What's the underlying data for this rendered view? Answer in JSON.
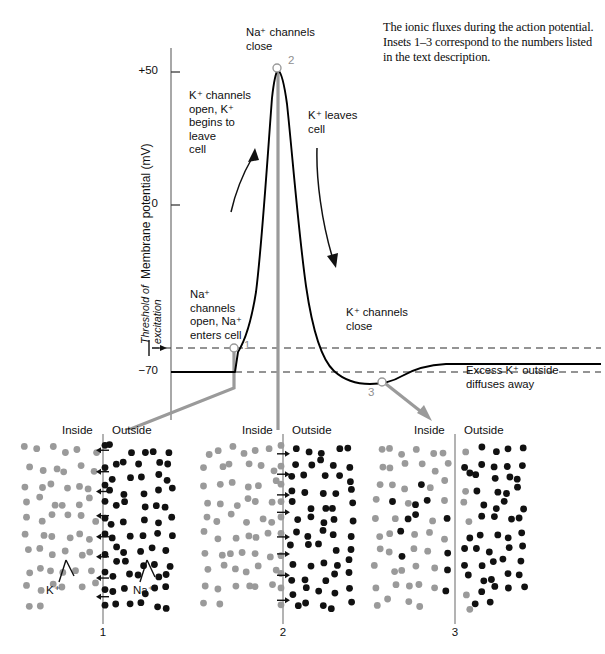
{
  "caption": {
    "text": "The ionic fluxes during the action potential. Insets 1–3 correspond to the numbers listed in the text description."
  },
  "chart_data": {
    "type": "line",
    "title": "",
    "xlabel": "",
    "ylabel": "Membrane potential (mV)",
    "ylim": [
      -90,
      70
    ],
    "ytick_labels": [
      "+50",
      "0",
      "−70"
    ],
    "ytick_values": [
      50,
      0,
      -70
    ],
    "grid": false,
    "legend": null,
    "series": [
      {
        "name": "Action potential",
        "x": [
          0,
          0.2,
          0.255,
          0.27,
          0.3,
          0.34,
          0.38,
          0.42,
          0.455,
          0.5,
          0.545,
          0.6,
          0.66,
          0.72,
          0.78,
          0.84,
          0.9,
          1.0
        ],
        "y": [
          -70,
          -70,
          -62,
          -55,
          -25,
          15,
          42,
          50,
          40,
          10,
          -20,
          -45,
          -62,
          -72,
          -78,
          -77,
          -73,
          -71
        ],
        "color": "#000000"
      }
    ],
    "reference_lines": [
      {
        "name": "threshold",
        "value": -55,
        "style": "dashed"
      },
      {
        "name": "resting",
        "value": -70,
        "style": "dashed"
      }
    ],
    "markers": [
      {
        "label": "1",
        "x_px": 234,
        "y_px": 348,
        "note": "threshold crossing, Na+ channels open"
      },
      {
        "label": "2",
        "x_px": 278,
        "y_px": 68,
        "note": "peak depolarization, Na+ channels close"
      },
      {
        "label": "3",
        "x_px": 382,
        "y_px": 382,
        "note": "hyperpolarization, K+ channels close"
      }
    ],
    "annotations": [
      {
        "id": "na-close",
        "text": "Na⁺ channels\nclose"
      },
      {
        "id": "k-open",
        "text": "K⁺ channels\nopen, K⁺\nbegins to\nleave\ncell"
      },
      {
        "id": "k-leaves",
        "text": "K⁺ leaves\ncell"
      },
      {
        "id": "na-open",
        "text": "Na⁺\nchannels\nopen, Na⁺\nenters cell"
      },
      {
        "id": "k-close",
        "text": "K⁺ channels\nclose"
      },
      {
        "id": "excess-k",
        "text": "Excess K⁺ outside\ndiffuses away"
      },
      {
        "id": "threshold",
        "text": "Threshold of\nexcitation"
      }
    ]
  },
  "axis": {
    "ylabel": "Membrane potential (mV)",
    "tick_plus50": "+50",
    "tick_zero": "0",
    "tick_minus70": "−70",
    "threshold_label": "Threshold of\nexcitation"
  },
  "annotations": {
    "na_close": "Na⁺ channels\nclose",
    "k_open": "K⁺ channels\nopen, K⁺\nbegins to\nleave\ncell",
    "k_leaves": "K⁺ leaves\ncell",
    "na_open": "Na⁺\nchannels\nopen, Na⁺\nenters cell",
    "k_close": "K⁺ channels\nclose",
    "excess_k": "Excess K⁺ outside\ndiffuses away"
  },
  "markers": {
    "one": "1",
    "two": "2",
    "three": "3"
  },
  "insets": [
    {
      "number": "1",
      "inside_label": "Inside",
      "outside_label": "Outside",
      "ion_inside_label": "K⁺",
      "ion_outside_label": "Na⁺",
      "flux_direction": "inward",
      "description": "Na⁺ enters cell"
    },
    {
      "number": "2",
      "inside_label": "Inside",
      "outside_label": "Outside",
      "ion_inside_label": "",
      "ion_outside_label": "",
      "flux_direction": "outward",
      "description": "K⁺ leaves cell"
    },
    {
      "number": "3",
      "inside_label": "Inside",
      "outside_label": "Outside",
      "ion_inside_label": "",
      "ion_outside_label": "",
      "flux_direction": "none",
      "description": "Excess K⁺ outside diffuses away"
    }
  ],
  "colors": {
    "curve": "#000000",
    "connector": "#8a8a8a",
    "marker_ring": "#8f8f8f",
    "potassium_dot": "#9a9a9a",
    "sodium_dot": "#111111",
    "membrane": "#8a8a8a",
    "text": "#0f0f0f",
    "background": "#ffffff"
  }
}
